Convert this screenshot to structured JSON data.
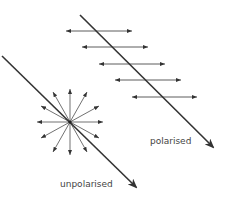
{
  "diagram": {
    "labels": {
      "polarised": "polarised",
      "unpolarised": "unpolarised"
    },
    "colors": {
      "line": "#333333",
      "text": "#444444",
      "background": "#ffffff"
    },
    "polarised_beam": {
      "start": [
        80,
        15
      ],
      "end": [
        213,
        147
      ],
      "oscillation_arrows": [
        {
          "y": 31,
          "x1": 66,
          "x2": 132
        },
        {
          "y": 47,
          "x1": 82,
          "x2": 148
        },
        {
          "y": 64,
          "x1": 99,
          "x2": 165
        },
        {
          "y": 80,
          "x1": 115,
          "x2": 181
        },
        {
          "y": 97,
          "x1": 132,
          "x2": 197
        }
      ]
    },
    "unpolarised_beam": {
      "start": [
        2,
        56
      ],
      "end": [
        136,
        187
      ],
      "starburst_center": [
        70,
        122
      ],
      "starburst_rays": 16
    }
  }
}
